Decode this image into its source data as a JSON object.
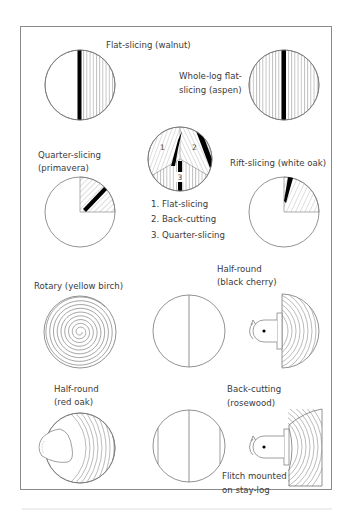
{
  "figure": {
    "panels": [
      {
        "id": "flat-slicing",
        "label": "Flat-slicing (walnut)"
      },
      {
        "id": "whole-log-flat-slicing",
        "label_lines": [
          "Whole-log flat-",
          "slicing (aspen)"
        ]
      },
      {
        "id": "quarter-slicing",
        "label_lines": [
          "Quarter-slicing",
          "(primavera)"
        ]
      },
      {
        "id": "combined",
        "numbers": [
          "1",
          "2",
          "3"
        ],
        "legend": [
          "1. Flat-slicing",
          "2. Back-cutting",
          "3. Quarter-slicing"
        ]
      },
      {
        "id": "rift-slicing",
        "label": "Rift-slicing (white oak)"
      },
      {
        "id": "rotary",
        "label": "Rotary (yellow birch)"
      },
      {
        "id": "half-round-black-cherry",
        "label_lines": [
          "Half-round",
          "(black cherry)"
        ]
      },
      {
        "id": "half-round-red-oak",
        "label_lines": [
          "Half-round",
          "(red oak)"
        ]
      },
      {
        "id": "back-cutting-rosewood",
        "label_lines": [
          "Back-cutting",
          "(rosewood)"
        ]
      },
      {
        "id": "flitch-note",
        "label_lines": [
          "Flitch mounted",
          "on stay-log"
        ]
      }
    ]
  }
}
